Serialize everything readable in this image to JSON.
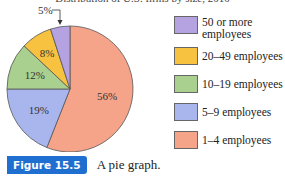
{
  "chart_data": {
    "type": "pie",
    "title": "Distribution of U.S. firms by size, 2010",
    "slices": [
      {
        "label": "1–4 employees",
        "value": 56,
        "display": "56%",
        "color": "#f5a489"
      },
      {
        "label": "5–9 employees",
        "value": 19,
        "display": "19%",
        "color": "#a9b6ee"
      },
      {
        "label": "10–19 employees",
        "value": 12,
        "display": "12%",
        "color": "#a9d08e"
      },
      {
        "label": "20–49 employees",
        "value": 8,
        "display": "8%",
        "color": "#f7c23f"
      },
      {
        "label": "50 or more employees",
        "value": 5,
        "display": "5%",
        "color": "#b4a3e0"
      }
    ],
    "legend": [
      {
        "label_lines": [
          "50 or more",
          "employees"
        ],
        "color": "#b4a3e0"
      },
      {
        "label_lines": [
          "20–49 employees"
        ],
        "color": "#f7c23f"
      },
      {
        "label_lines": [
          "10–19 employees"
        ],
        "color": "#a9d08e"
      },
      {
        "label_lines": [
          "5–9 employees"
        ],
        "color": "#a9b6ee"
      },
      {
        "label_lines": [
          "1–4 employees"
        ],
        "color": "#f5a489"
      }
    ],
    "legend_position": "right"
  },
  "caption": {
    "tag": "Figure 15.5",
    "text": "A pie graph.",
    "tag_color": "#1f6fd0"
  }
}
